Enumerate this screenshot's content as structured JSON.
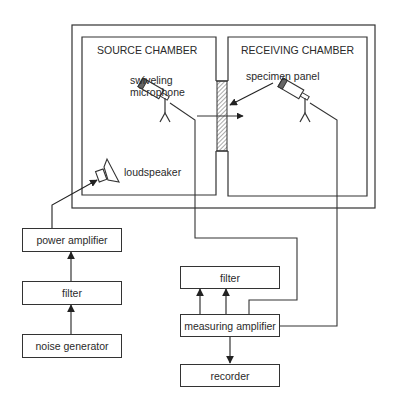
{
  "diagram": {
    "type": "block-diagram",
    "chambers": {
      "source": {
        "label": "SOURCE CHAMBER"
      },
      "receiving": {
        "label": "RECEIVING CHAMBER"
      }
    },
    "annotations": {
      "swiveling_microphone": [
        "swiveling",
        "microphone"
      ],
      "specimen_panel": "specimen panel",
      "loudspeaker": "loudspeaker"
    },
    "source_chain": [
      {
        "id": "power-amplifier",
        "label": "power amplifier"
      },
      {
        "id": "filter-left",
        "label": "filter"
      },
      {
        "id": "noise-generator",
        "label": "noise generator"
      }
    ],
    "measurement_chain": [
      {
        "id": "filter-right",
        "label": "filter"
      },
      {
        "id": "measuring-amplifier",
        "label": "measuring amplifier"
      },
      {
        "id": "recorder",
        "label": "recorder"
      }
    ],
    "connections": [
      {
        "from": "noise generator",
        "to": "filter"
      },
      {
        "from": "filter",
        "to": "power amplifier"
      },
      {
        "from": "power amplifier",
        "to": "loudspeaker"
      },
      {
        "from": "source microphone",
        "to": "measuring amplifier"
      },
      {
        "from": "receiving microphone",
        "to": "measuring amplifier"
      },
      {
        "from": "measuring amplifier",
        "to": "filter"
      },
      {
        "from": "measuring amplifier",
        "to": "filter"
      },
      {
        "from": "measuring amplifier",
        "to": "recorder"
      }
    ],
    "colors": {
      "line": "#333333",
      "background": "#ffffff"
    }
  }
}
